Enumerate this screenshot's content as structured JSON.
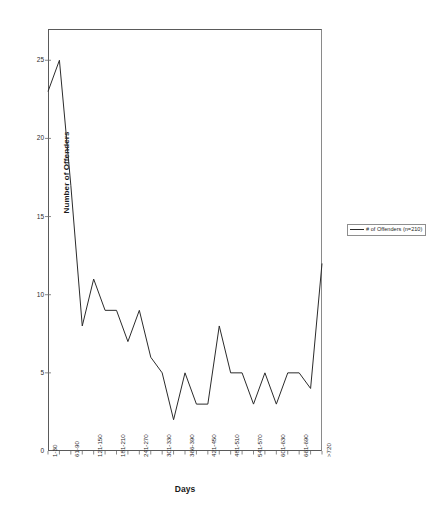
{
  "chart_data": {
    "type": "line",
    "title": "",
    "xlabel": "Days",
    "ylabel": "Number of Offenders",
    "ylim": [
      0,
      27
    ],
    "yticks": [
      0,
      5,
      10,
      15,
      20,
      25
    ],
    "ytick_labels": [
      "0",
      "5",
      "10",
      "15",
      "20",
      "25"
    ],
    "grid": false,
    "legend_position": "right-outside",
    "legend": [
      "# of Offenders (n=210)"
    ],
    "series_color": "#2b2b2b",
    "categories": [
      "1-30",
      "31-60",
      "61-90",
      "91-120",
      "121-150",
      "151-180",
      "181-210",
      "211-240",
      "241-270",
      "271-300",
      "301-330",
      "331-365",
      "366-390",
      "391-420",
      "421-450",
      "451-480",
      "481-510",
      "511-540",
      "541-570",
      "571-600",
      "601-630",
      "631-660",
      "661-690",
      "691-720",
      ">720"
    ],
    "xtick_labels_shown": [
      "1-30",
      "61-90",
      "121-150",
      "181-210",
      "241-270",
      "301-330",
      "366-390",
      "421-450",
      "481-510",
      "541-570",
      "601-630",
      "661-690",
      ">720"
    ],
    "series": [
      {
        "name": "# of Offenders (n=210)",
        "values": [
          23,
          25,
          17,
          8,
          11,
          9,
          9,
          7,
          9,
          6,
          5,
          2,
          5,
          3,
          3,
          8,
          5,
          5,
          3,
          5,
          3,
          5,
          5,
          4,
          12
        ]
      }
    ]
  },
  "axis": {
    "x_label": "Days",
    "y_label": "Number of Offenders"
  },
  "legend_box": {
    "label": "# of Offenders (n=210)"
  }
}
